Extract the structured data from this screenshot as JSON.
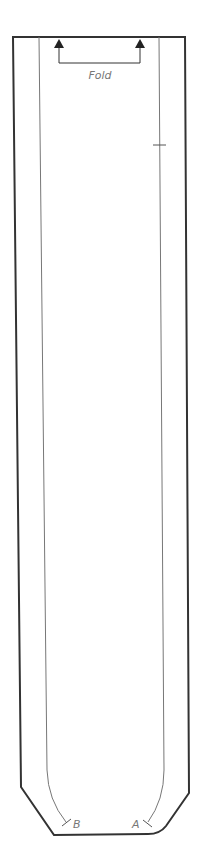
{
  "pattern": {
    "fold_label": "Fold",
    "notch_a_label": "A",
    "notch_b_label": "B",
    "colors": {
      "cut_line": "#333333",
      "stitch_line": "#666666",
      "label": "#777777",
      "background": "#ffffff"
    }
  }
}
